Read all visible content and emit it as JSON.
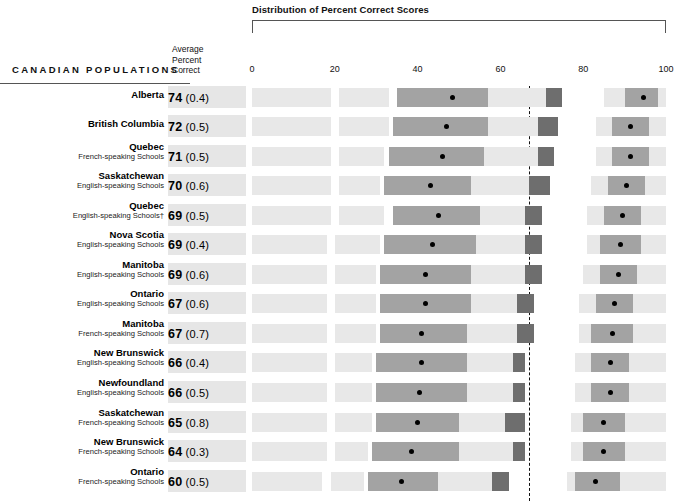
{
  "header": {
    "distribution_title": "Distribution of Percent Correct Scores",
    "populations_label": "CANADIAN POPULATIONS",
    "average_label_line1": "Average",
    "average_label_line2": "Percent",
    "average_label_line3": "Correct"
  },
  "colors": {
    "band": "#e8e8e8",
    "box_mid": "#a3a3a3",
    "box_dark": "#6e6e6e",
    "dot": "#000000",
    "score_cell": "#e6e6e6"
  },
  "chart_data": {
    "type": "bar",
    "title": "Distribution of Percent Correct Scores",
    "xlabel": "",
    "ylabel": "CANADIAN POPULATIONS",
    "xlim": [
      0,
      100
    ],
    "xticks": [
      0,
      20,
      40,
      60,
      80,
      100
    ],
    "xtick_labels": [
      "0",
      "20",
      "40",
      "60",
      "80",
      "100"
    ],
    "grid": false,
    "legend": "none",
    "reference_line": 67,
    "categories": [
      "Alberta",
      "British Columbia",
      "Quebec French-speaking Schools",
      "Saskatchewan English-speaking Schools",
      "Quebec English-speaking Schools†",
      "Nova Scotia English-speaking Schools",
      "Manitoba English-speaking Schools",
      "Ontario English-speaking Schools",
      "Manitoba French-speaking Schools",
      "New Brunswick English-speaking Schools",
      "Newfoundland English-speaking Schools",
      "Saskatchewan French-speaking Schools",
      "New Brunswick French-speaking Schools",
      "Ontario French-speaking Schools"
    ],
    "values": [
      74,
      72,
      71,
      70,
      69,
      69,
      69,
      67,
      67,
      66,
      66,
      65,
      64,
      60
    ],
    "standard_errors": [
      0.4,
      0.5,
      0.5,
      0.6,
      0.5,
      0.4,
      0.6,
      0.6,
      0.7,
      0.4,
      0.5,
      0.8,
      0.3,
      0.5
    ]
  },
  "rows": [
    {
      "name": "Alberta",
      "sub": "",
      "score": "74",
      "se": "(0.4)",
      "bands": [
        [
          0,
          19
        ],
        [
          21,
          33
        ],
        [
          57,
          71
        ],
        [
          85,
          100
        ]
      ],
      "mid_box": [
        35,
        57
      ],
      "mean_dot": 48.5,
      "dark_box": [
        71,
        75
      ],
      "right_box": [
        90,
        98
      ],
      "right_dot": 94.5
    },
    {
      "name": "British Columbia",
      "sub": "",
      "score": "72",
      "se": "(0.5)",
      "bands": [
        [
          0,
          19
        ],
        [
          21,
          33
        ],
        [
          57,
          70
        ],
        [
          83,
          100
        ]
      ],
      "mid_box": [
        34,
        57
      ],
      "mean_dot": 47,
      "dark_box": [
        69,
        74
      ],
      "right_box": [
        87,
        96
      ],
      "right_dot": 91.5
    },
    {
      "name": "Quebec",
      "sub": "French-speaking Schools",
      "score": "71",
      "se": "(0.5)",
      "bands": [
        [
          0,
          19
        ],
        [
          21,
          32
        ],
        [
          56,
          70
        ],
        [
          83,
          100
        ]
      ],
      "mid_box": [
        33,
        56
      ],
      "mean_dot": 46,
      "dark_box": [
        69,
        73
      ],
      "right_box": [
        87,
        96
      ],
      "right_dot": 91.5
    },
    {
      "name": "Saskatchewan",
      "sub": "English-speaking Schools",
      "score": "70",
      "se": "(0.6)",
      "bands": [
        [
          0,
          19
        ],
        [
          21,
          31
        ],
        [
          53,
          68
        ],
        [
          82,
          100
        ]
      ],
      "mid_box": [
        32,
        53
      ],
      "mean_dot": 43,
      "dark_box": [
        67,
        72
      ],
      "right_box": [
        86,
        95
      ],
      "right_dot": 90.5
    },
    {
      "name": "Quebec",
      "sub": "English-speaking Schools†",
      "score": "69",
      "se": "(0.5)",
      "bands": [
        [
          0,
          19
        ],
        [
          21,
          32
        ],
        [
          55,
          67
        ],
        [
          81,
          100
        ]
      ],
      "mid_box": [
        34,
        55
      ],
      "mean_dot": 45,
      "dark_box": [
        66,
        70
      ],
      "right_box": [
        85,
        94
      ],
      "right_dot": 89.5
    },
    {
      "name": "Nova Scotia",
      "sub": "English-speaking Schools",
      "score": "69",
      "se": "(0.4)",
      "bands": [
        [
          0,
          18
        ],
        [
          20,
          31
        ],
        [
          54,
          66
        ],
        [
          81,
          100
        ]
      ],
      "mid_box": [
        32,
        54
      ],
      "mean_dot": 43.5,
      "dark_box": [
        66,
        70
      ],
      "right_box": [
        84,
        94
      ],
      "right_dot": 89
    },
    {
      "name": "Manitoba",
      "sub": "English-speaking Schools",
      "score": "69",
      "se": "(0.6)",
      "bands": [
        [
          0,
          18
        ],
        [
          20,
          30
        ],
        [
          53,
          66
        ],
        [
          80,
          100
        ]
      ],
      "mid_box": [
        31,
        53
      ],
      "mean_dot": 42,
      "dark_box": [
        66,
        70
      ],
      "right_box": [
        84,
        93
      ],
      "right_dot": 88.5
    },
    {
      "name": "Ontario",
      "sub": "English-speaking Schools",
      "score": "67",
      "se": "(0.6)",
      "bands": [
        [
          0,
          18
        ],
        [
          20,
          30
        ],
        [
          53,
          65
        ],
        [
          79,
          100
        ]
      ],
      "mid_box": [
        31,
        53
      ],
      "mean_dot": 42,
      "dark_box": [
        64,
        68
      ],
      "right_box": [
        83,
        92
      ],
      "right_dot": 87.5
    },
    {
      "name": "Manitoba",
      "sub": "French-speaking Schools",
      "score": "67",
      "se": "(0.7)",
      "bands": [
        [
          0,
          18
        ],
        [
          20,
          30
        ],
        [
          52,
          65
        ],
        [
          79,
          100
        ]
      ],
      "mid_box": [
        31,
        52
      ],
      "mean_dot": 41,
      "dark_box": [
        64,
        68
      ],
      "right_box": [
        82,
        92
      ],
      "right_dot": 87
    },
    {
      "name": "New Brunswick",
      "sub": "English-speaking Schools",
      "score": "66",
      "se": "(0.4)",
      "bands": [
        [
          0,
          18
        ],
        [
          20,
          29
        ],
        [
          52,
          64
        ],
        [
          78,
          100
        ]
      ],
      "mid_box": [
        30,
        52
      ],
      "mean_dot": 41,
      "dark_box": [
        63,
        66
      ],
      "right_box": [
        82,
        91
      ],
      "right_dot": 86.5
    },
    {
      "name": "Newfoundland",
      "sub": "English-speaking Schools",
      "score": "66",
      "se": "(0.5)",
      "bands": [
        [
          0,
          18
        ],
        [
          20,
          29
        ],
        [
          52,
          64
        ],
        [
          78,
          100
        ]
      ],
      "mid_box": [
        30,
        52
      ],
      "mean_dot": 40.5,
      "dark_box": [
        63,
        66
      ],
      "right_box": [
        82,
        91
      ],
      "right_dot": 86.5
    },
    {
      "name": "Saskatchewan",
      "sub": "French-speaking Schools",
      "score": "65",
      "se": "(0.8)",
      "bands": [
        [
          0,
          18
        ],
        [
          20,
          29
        ],
        [
          50,
          63
        ],
        [
          77,
          100
        ]
      ],
      "mid_box": [
        30,
        50
      ],
      "mean_dot": 40,
      "dark_box": [
        61,
        66
      ],
      "right_box": [
        80,
        90
      ],
      "right_dot": 85
    },
    {
      "name": "New Brunswick",
      "sub": "French-speaking Schools",
      "score": "64",
      "se": "(0.3)",
      "bands": [
        [
          0,
          18
        ],
        [
          20,
          28
        ],
        [
          50,
          63
        ],
        [
          77,
          100
        ]
      ],
      "mid_box": [
        29,
        50
      ],
      "mean_dot": 38.5,
      "dark_box": [
        63,
        66
      ],
      "right_box": [
        80,
        90
      ],
      "right_dot": 85
    },
    {
      "name": "Ontario",
      "sub": "French-speaking Schools",
      "score": "60",
      "se": "(0.5)",
      "bands": [
        [
          0,
          17
        ],
        [
          19,
          27
        ],
        [
          45,
          62
        ],
        [
          76,
          100
        ]
      ],
      "mid_box": [
        28,
        45
      ],
      "mean_dot": 36,
      "dark_box": [
        58,
        62
      ],
      "right_box": [
        78,
        89
      ],
      "right_dot": 83
    }
  ]
}
